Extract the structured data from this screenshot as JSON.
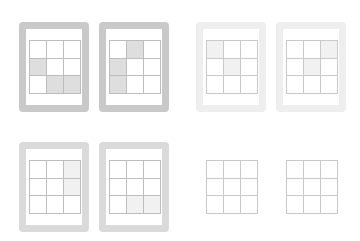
{
  "colors": {
    "frame_dark": "#c9c9c9",
    "frame_mid": "#dadada",
    "frame_light": "#eeeeee",
    "fill_dark": "#dedede",
    "fill_light": "#f1f1f1",
    "grid_line": "#bdbdbd"
  },
  "tiles": [
    {
      "id": 1,
      "x": 19,
      "y": 22,
      "framed": true,
      "frame": "frame_dark",
      "fill": "fill_dark",
      "filled": [
        [
          1,
          0
        ],
        [
          2,
          1
        ],
        [
          2,
          2
        ]
      ]
    },
    {
      "id": 2,
      "x": 99,
      "y": 22,
      "framed": true,
      "frame": "frame_dark",
      "fill": "fill_dark",
      "filled": [
        [
          0,
          1
        ],
        [
          1,
          0
        ],
        [
          2,
          0
        ]
      ]
    },
    {
      "id": 3,
      "x": 196,
      "y": 22,
      "framed": true,
      "frame": "frame_light",
      "fill": "fill_light",
      "filled": [
        [
          0,
          0
        ],
        [
          1,
          1
        ]
      ]
    },
    {
      "id": 4,
      "x": 276,
      "y": 22,
      "framed": true,
      "frame": "frame_light",
      "fill": "fill_light",
      "filled": [
        [
          0,
          2
        ],
        [
          1,
          1
        ]
      ]
    },
    {
      "id": 5,
      "x": 19,
      "y": 142,
      "framed": true,
      "frame": "frame_mid",
      "fill": "fill_light",
      "filled": [
        [
          0,
          2
        ],
        [
          1,
          2
        ]
      ]
    },
    {
      "id": 6,
      "x": 99,
      "y": 142,
      "framed": true,
      "frame": "frame_mid",
      "fill": "fill_light",
      "filled": [
        [
          2,
          1
        ],
        [
          2,
          2
        ]
      ]
    },
    {
      "id": 7,
      "x": 196,
      "y": 142,
      "framed": false,
      "frame": null,
      "fill": "fill_light",
      "filled": []
    },
    {
      "id": 8,
      "x": 276,
      "y": 142,
      "framed": false,
      "frame": null,
      "fill": "fill_light",
      "filled": []
    }
  ]
}
